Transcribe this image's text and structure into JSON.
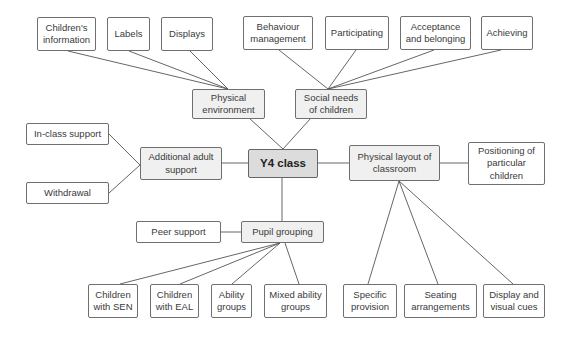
{
  "diagram": {
    "title": "Y4 class",
    "colors": {
      "center_fill": "#dcdcdc",
      "hub_fill": "#f0f0f0",
      "leaf_fill": "#ffffff",
      "border": "#6f6f6f",
      "line": "#555555"
    },
    "nodes": [
      {
        "id": "y4",
        "label": "Y4 class",
        "type": "center",
        "x": 248,
        "y": 149,
        "w": 70,
        "h": 29
      },
      {
        "id": "physenv",
        "label": "Physical\nenvironment",
        "type": "hub",
        "x": 192,
        "y": 89,
        "w": 73,
        "h": 30
      },
      {
        "id": "social",
        "label": "Social needs\nof children",
        "type": "hub",
        "x": 295,
        "y": 89,
        "w": 72,
        "h": 30
      },
      {
        "id": "adult",
        "label": "Additional adult\nsupport",
        "type": "hub",
        "x": 140,
        "y": 147,
        "w": 82,
        "h": 33
      },
      {
        "id": "layout",
        "label": "Physical layout of\nclassroom",
        "type": "hub",
        "x": 349,
        "y": 145,
        "w": 91,
        "h": 36
      },
      {
        "id": "pupil",
        "label": "Pupil grouping",
        "type": "hub",
        "x": 241,
        "y": 221,
        "w": 83,
        "h": 22
      },
      {
        "id": "chinfo",
        "label": "Children's\ninformation",
        "type": "leaf",
        "x": 37,
        "y": 17,
        "w": 59,
        "h": 34
      },
      {
        "id": "labels",
        "label": "Labels",
        "type": "leaf",
        "x": 107,
        "y": 17,
        "w": 43,
        "h": 34
      },
      {
        "id": "displays",
        "label": "Displays",
        "type": "leaf",
        "x": 161,
        "y": 17,
        "w": 52,
        "h": 34
      },
      {
        "id": "behav",
        "label": "Behaviour\nmanagement",
        "type": "leaf",
        "x": 243,
        "y": 16,
        "w": 70,
        "h": 34
      },
      {
        "id": "partic",
        "label": "Participating",
        "type": "leaf",
        "x": 325,
        "y": 16,
        "w": 64,
        "h": 34
      },
      {
        "id": "accept",
        "label": "Acceptance\nand belonging",
        "type": "leaf",
        "x": 400,
        "y": 16,
        "w": 71,
        "h": 34
      },
      {
        "id": "achiev",
        "label": "Achieving",
        "type": "leaf",
        "x": 481,
        "y": 16,
        "w": 52,
        "h": 34
      },
      {
        "id": "inclass",
        "label": "In-class support",
        "type": "leaf",
        "x": 26,
        "y": 123,
        "w": 83,
        "h": 22
      },
      {
        "id": "withdraw",
        "label": "Withdrawal",
        "type": "leaf",
        "x": 26,
        "y": 182,
        "w": 83,
        "h": 22
      },
      {
        "id": "position",
        "label": "Positioning of\nparticular\nchildren",
        "type": "leaf",
        "x": 468,
        "y": 142,
        "w": 77,
        "h": 43
      },
      {
        "id": "peer",
        "label": "Peer support",
        "type": "leaf",
        "x": 136,
        "y": 221,
        "w": 85,
        "h": 22
      },
      {
        "id": "sen",
        "label": "Children\nwith SEN",
        "type": "leaf",
        "x": 88,
        "y": 284,
        "w": 50,
        "h": 34
      },
      {
        "id": "eal",
        "label": "Children\nwith EAL",
        "type": "leaf",
        "x": 150,
        "y": 284,
        "w": 49,
        "h": 34
      },
      {
        "id": "ability",
        "label": "Ability\ngroups",
        "type": "leaf",
        "x": 211,
        "y": 284,
        "w": 41,
        "h": 34
      },
      {
        "id": "mixed",
        "label": "Mixed ability\ngroups",
        "type": "leaf",
        "x": 264,
        "y": 284,
        "w": 63,
        "h": 34
      },
      {
        "id": "specific",
        "label": "Specific\nprovision",
        "type": "leaf",
        "x": 343,
        "y": 284,
        "w": 54,
        "h": 34
      },
      {
        "id": "seating",
        "label": "Seating\narrangements",
        "type": "leaf",
        "x": 404,
        "y": 284,
        "w": 73,
        "h": 34
      },
      {
        "id": "dispcues",
        "label": "Display and\nvisual cues",
        "type": "leaf",
        "x": 483,
        "y": 284,
        "w": 62,
        "h": 34
      }
    ],
    "edges": [
      {
        "from": "y4",
        "to": "physenv",
        "x1": 283,
        "y1": 149,
        "x2": 249,
        "y2": 118
      },
      {
        "from": "y4",
        "to": "social",
        "x1": 283,
        "y1": 149,
        "x2": 311,
        "y2": 118
      },
      {
        "from": "y4",
        "to": "adult",
        "x1": 248,
        "y1": 163,
        "x2": 222,
        "y2": 163
      },
      {
        "from": "y4",
        "to": "layout",
        "x1": 318,
        "y1": 163,
        "x2": 349,
        "y2": 163
      },
      {
        "from": "y4",
        "to": "pupil",
        "x1": 282,
        "y1": 178,
        "x2": 282,
        "y2": 221
      },
      {
        "from": "physenv",
        "to": "chinfo",
        "x1": 228,
        "y1": 89,
        "x2": 68,
        "y2": 51
      },
      {
        "from": "physenv",
        "to": "labels",
        "x1": 228,
        "y1": 89,
        "x2": 129,
        "y2": 51
      },
      {
        "from": "physenv",
        "to": "displays",
        "x1": 228,
        "y1": 89,
        "x2": 190,
        "y2": 51
      },
      {
        "from": "social",
        "to": "behav",
        "x1": 328,
        "y1": 89,
        "x2": 279,
        "y2": 50
      },
      {
        "from": "social",
        "to": "partic",
        "x1": 328,
        "y1": 89,
        "x2": 356,
        "y2": 50
      },
      {
        "from": "social",
        "to": "accept",
        "x1": 328,
        "y1": 89,
        "x2": 434,
        "y2": 50
      },
      {
        "from": "social",
        "to": "achiev",
        "x1": 328,
        "y1": 89,
        "x2": 501,
        "y2": 50
      },
      {
        "from": "adult",
        "to": "inclass",
        "x1": 140,
        "y1": 165,
        "x2": 109,
        "y2": 134
      },
      {
        "from": "adult",
        "to": "withdraw",
        "x1": 140,
        "y1": 165,
        "x2": 109,
        "y2": 193
      },
      {
        "from": "layout",
        "to": "position",
        "x1": 440,
        "y1": 163,
        "x2": 468,
        "y2": 163
      },
      {
        "from": "layout",
        "to": "specific",
        "x1": 399,
        "y1": 181,
        "x2": 368,
        "y2": 284
      },
      {
        "from": "layout",
        "to": "seating",
        "x1": 399,
        "y1": 181,
        "x2": 438,
        "y2": 284
      },
      {
        "from": "layout",
        "to": "dispcues",
        "x1": 399,
        "y1": 181,
        "x2": 513,
        "y2": 284
      },
      {
        "from": "pupil",
        "to": "peer",
        "x1": 241,
        "y1": 232,
        "x2": 221,
        "y2": 232
      },
      {
        "from": "pupil",
        "to": "sen",
        "x1": 280,
        "y1": 243,
        "x2": 120,
        "y2": 284
      },
      {
        "from": "pupil",
        "to": "eal",
        "x1": 280,
        "y1": 243,
        "x2": 180,
        "y2": 284
      },
      {
        "from": "pupil",
        "to": "ability",
        "x1": 280,
        "y1": 243,
        "x2": 232,
        "y2": 284
      },
      {
        "from": "pupil",
        "to": "mixed",
        "x1": 285,
        "y1": 243,
        "x2": 299,
        "y2": 284
      }
    ]
  }
}
